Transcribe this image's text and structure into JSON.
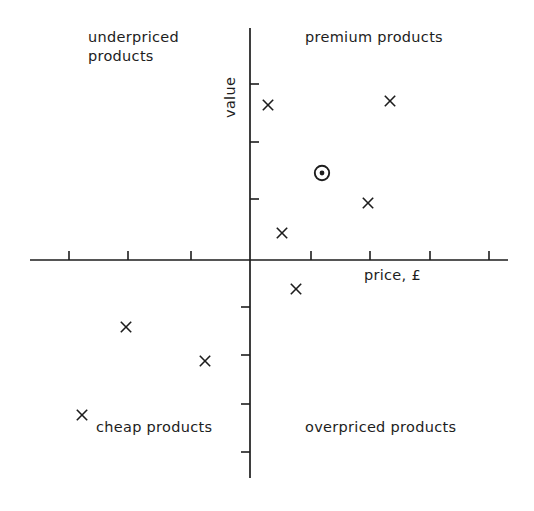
{
  "figure": {
    "background_color": "#ffffff",
    "ink_color": "#1d1d1d",
    "width": 534,
    "height": 511
  },
  "axes": {
    "x_axis_label": "price, £",
    "y_axis_label": "value",
    "x_axis_y_pixel": 260,
    "y_axis_x_pixel": 250,
    "x_axis_start_pixel": 30,
    "x_axis_end_pixel": 508,
    "y_axis_start_pixel": 28,
    "y_axis_end_pixel": 478,
    "x_ticks_left": [
      69,
      128,
      191
    ],
    "x_ticks_right": [
      311,
      370,
      430,
      489
    ],
    "y_ticks_above": [
      84,
      142,
      199
    ],
    "y_ticks_below": [
      307,
      355,
      404,
      452
    ],
    "tick_length": 9
  },
  "quadrants": [
    {
      "key": "underpriced",
      "label": "underpriced\nproducts",
      "position": "top-left"
    },
    {
      "key": "premium",
      "label": "premium products",
      "position": "top-right"
    },
    {
      "key": "cheap",
      "label": "cheap products",
      "position": "bottom-left"
    },
    {
      "key": "overpriced",
      "label": "overpriced products",
      "position": "bottom-right"
    }
  ],
  "chart_data": {
    "type": "scatter",
    "title": "",
    "xlabel": "price, £",
    "ylabel": "value",
    "grid": false,
    "legend": "none",
    "axis_style": "crossed-axes-at-origin",
    "xlim": [
      -3.8,
      4.4
    ],
    "ylim": [
      -4.6,
      4.0
    ],
    "quadrant_annotations": [
      {
        "text": "underpriced products",
        "quadrant": "top-left"
      },
      {
        "text": "premium products",
        "quadrant": "top-right"
      },
      {
        "text": "cheap products",
        "quadrant": "bottom-left"
      },
      {
        "text": "overpriced products",
        "quadrant": "bottom-right"
      }
    ],
    "series": [
      {
        "name": "products",
        "marker": "x",
        "points": [
          {
            "x": 0.31,
            "y": 2.63,
            "px": 268,
            "py": 105
          },
          {
            "x": 2.29,
            "y": 2.7,
            "px": 390,
            "py": 101
          },
          {
            "x": 1.92,
            "y": 1.02,
            "px": 368,
            "py": 203
          },
          {
            "x": 0.54,
            "y": 0.46,
            "px": 282,
            "py": 233
          },
          {
            "x": 0.78,
            "y": -0.49,
            "px": 296,
            "py": 289
          },
          {
            "x": -2.02,
            "y": -1.13,
            "px": 126,
            "py": 327
          },
          {
            "x": -0.73,
            "y": -1.69,
            "px": 205,
            "py": 361
          },
          {
            "x": -2.74,
            "y": -2.58,
            "px": 82,
            "py": 415
          }
        ]
      },
      {
        "name": "own product",
        "marker": "circled-dot",
        "points": [
          {
            "x": 1.17,
            "y": 1.48,
            "px": 322,
            "py": 173
          }
        ]
      }
    ]
  }
}
